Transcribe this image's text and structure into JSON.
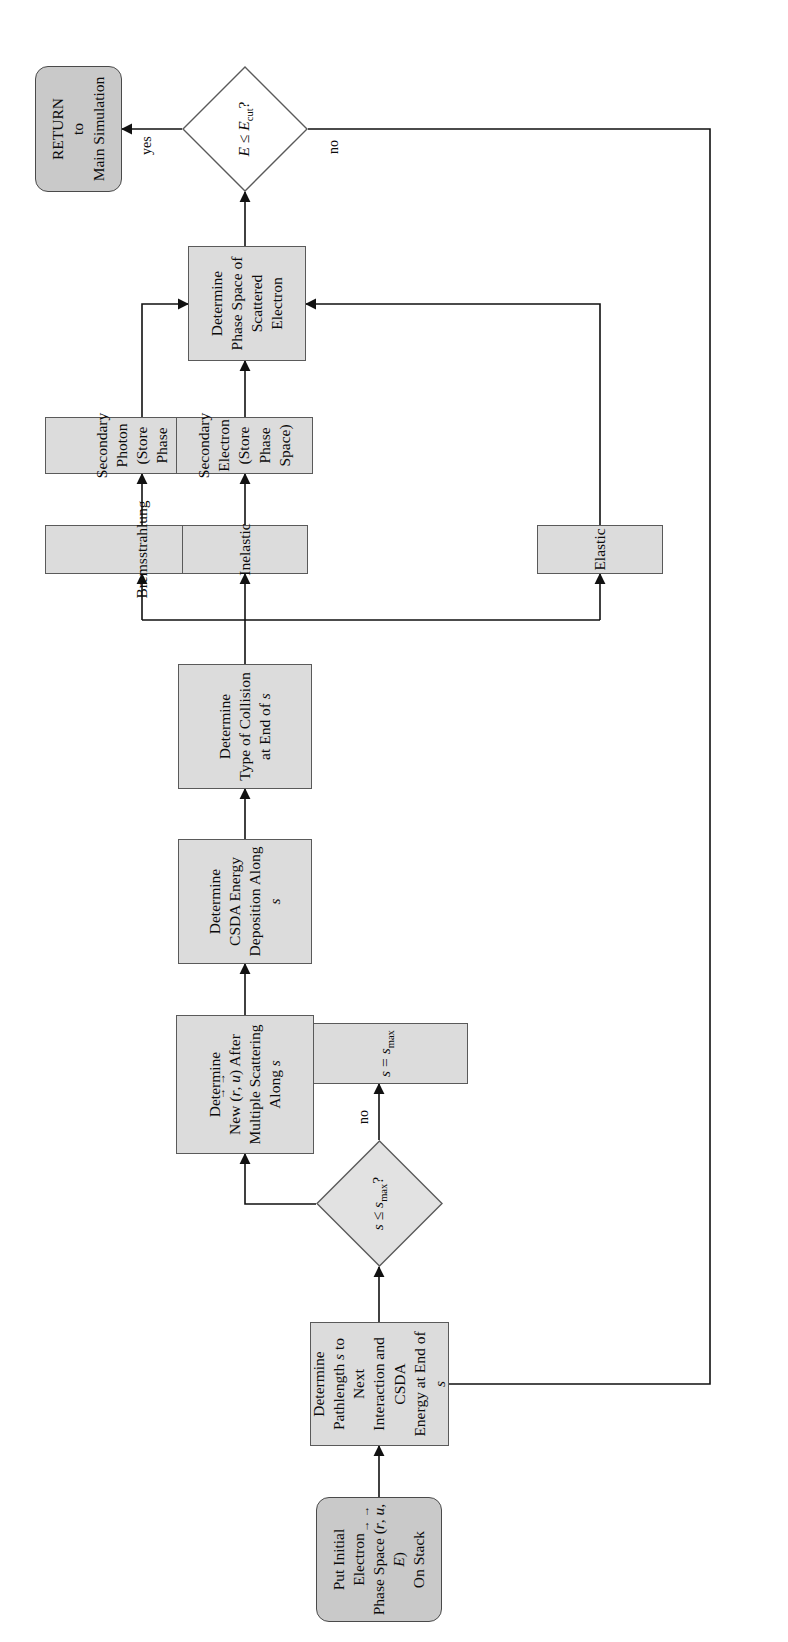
{
  "diagram": {
    "type": "flowchart",
    "orientation": "rotated-90-ccw",
    "colors": {
      "terminal_fill": "#c9c9c9",
      "process_fill": "#dcdcdc",
      "stroke": "#5a5a5a",
      "wire": "#111111",
      "text": "#0b0b0b",
      "background": "#ffffff"
    },
    "nodes": {
      "start": {
        "id": "start",
        "shape": "terminal",
        "lines": [
          "Put Initial Electron",
          "Phase Space (r, u, E)",
          "On Stack"
        ],
        "label": "Put Initial Electron Phase Space (r⃗, u⃗, E) On Stack"
      },
      "pathlength": {
        "id": "pathlength",
        "shape": "process",
        "lines": [
          "Determine",
          "Pathlength s to Next",
          "Interaction and CSDA",
          "Energy at End of s"
        ],
        "label": "Determine Pathlength s to Next Interaction and CSDA Energy at End of s"
      },
      "smax_decision": {
        "id": "smax_decision",
        "shape": "decision",
        "label": "s ≤ s_max ?"
      },
      "set_smax": {
        "id": "set_smax",
        "shape": "process",
        "label": "s = s_max"
      },
      "multiple_scattering": {
        "id": "multiple_scattering",
        "shape": "process",
        "lines": [
          "Determine",
          "New (r, u) After",
          "Multiple Scattering",
          "Along s"
        ],
        "label": "Determine New (r⃗, u⃗) After Multiple Scattering Along s"
      },
      "csda_deposit": {
        "id": "csda_deposit",
        "shape": "process",
        "lines": [
          "Determine",
          "CSDA Energy",
          "Deposition Along s"
        ],
        "label": "Determine CSDA Energy Deposition Along s"
      },
      "collision_type": {
        "id": "collision_type",
        "shape": "process",
        "lines": [
          "Determine",
          "Type of Collision",
          "at End of s"
        ],
        "label": "Determine Type of Collision at End of s"
      },
      "bremsstrahlung": {
        "id": "bremsstrahlung",
        "shape": "process",
        "label": "Bremsstrahlung"
      },
      "inelastic": {
        "id": "inelastic",
        "shape": "process",
        "label": "Inelastic"
      },
      "elastic": {
        "id": "elastic",
        "shape": "process",
        "label": "Elastic"
      },
      "secondary_photon": {
        "id": "secondary_photon",
        "shape": "process",
        "lines": [
          "Secondary Photon",
          "(Store Phase Space)"
        ],
        "label": "Secondary Photon (Store Phase Space)"
      },
      "secondary_electron": {
        "id": "secondary_electron",
        "shape": "process",
        "lines": [
          "Secondary Electron",
          "(Store Phase Space)"
        ],
        "label": "Secondary Electron (Store Phase Space)"
      },
      "scattered_phase_space": {
        "id": "scattered_phase_space",
        "shape": "process",
        "lines": [
          "Determine",
          "Phase Space of",
          "Scattered Electron"
        ],
        "label": "Determine Phase Space of Scattered Electron"
      },
      "ecut_decision": {
        "id": "ecut_decision",
        "shape": "decision",
        "label": "E ≤ E_cut ?"
      },
      "return_node": {
        "id": "return_node",
        "shape": "terminal",
        "lines": [
          "RETURN",
          "to",
          "Main Simulation"
        ],
        "label": "RETURN to Main Simulation"
      }
    },
    "edge_labels": {
      "smax_no": "no",
      "ecut_yes": "yes",
      "ecut_no": "no"
    },
    "edges": [
      {
        "from": "start",
        "to": "pathlength",
        "label": ""
      },
      {
        "from": "pathlength",
        "to": "smax_decision",
        "label": ""
      },
      {
        "from": "smax_decision",
        "to": "set_smax",
        "label": "no"
      },
      {
        "from": "smax_decision",
        "to": "multiple_scattering",
        "label": ""
      },
      {
        "from": "set_smax",
        "to": "multiple_scattering",
        "label": ""
      },
      {
        "from": "multiple_scattering",
        "to": "csda_deposit",
        "label": ""
      },
      {
        "from": "csda_deposit",
        "to": "collision_type",
        "label": ""
      },
      {
        "from": "collision_type",
        "to": "bremsstrahlung",
        "label": ""
      },
      {
        "from": "collision_type",
        "to": "inelastic",
        "label": ""
      },
      {
        "from": "collision_type",
        "to": "elastic",
        "label": ""
      },
      {
        "from": "bremsstrahlung",
        "to": "secondary_photon",
        "label": ""
      },
      {
        "from": "inelastic",
        "to": "secondary_electron",
        "label": ""
      },
      {
        "from": "secondary_photon",
        "to": "scattered_phase_space",
        "label": ""
      },
      {
        "from": "secondary_electron",
        "to": "scattered_phase_space",
        "label": ""
      },
      {
        "from": "elastic",
        "to": "scattered_phase_space",
        "label": ""
      },
      {
        "from": "scattered_phase_space",
        "to": "ecut_decision",
        "label": ""
      },
      {
        "from": "ecut_decision",
        "to": "return_node",
        "label": "yes"
      },
      {
        "from": "ecut_decision",
        "to": "pathlength",
        "label": "no"
      }
    ]
  }
}
